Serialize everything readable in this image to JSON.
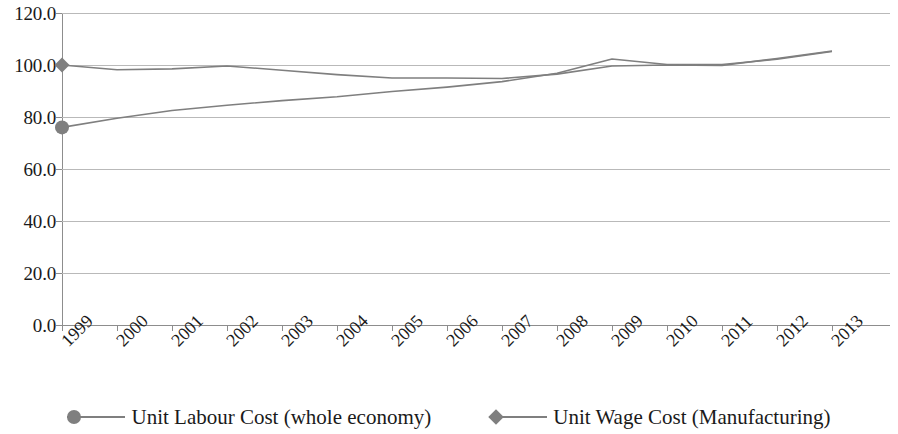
{
  "chart_data": {
    "type": "line",
    "title": "",
    "subtitle": "",
    "xlabel": "",
    "ylabel": "",
    "categories": [
      "1999",
      "2000",
      "2001",
      "2002",
      "2003",
      "2004",
      "2005",
      "2006",
      "2007",
      "2008",
      "2009",
      "2010",
      "2011",
      "2012",
      "2013"
    ],
    "x_tick_labels": [
      "1999",
      "2000",
      "2001",
      "2002",
      "2003",
      "2004",
      "2005",
      "2006",
      "2007",
      "2008",
      "2009",
      "2010",
      "2011",
      "2012",
      "2013"
    ],
    "y_tick_labels": [
      "0.0",
      "20.0",
      "40.0",
      "60.0",
      "80.0",
      "100.0",
      "120.0"
    ],
    "y_ticks": [
      0,
      20,
      40,
      60,
      80,
      100,
      120
    ],
    "ylim": [
      0,
      120
    ],
    "grid": true,
    "grid_axis": "y",
    "legend_position": "bottom",
    "series": [
      {
        "name": "Unit Labour Cost (whole economy)",
        "marker": "circle",
        "color": "#7f7f7f",
        "values": [
          76.0,
          79.5,
          82.5,
          84.5,
          86.3,
          87.8,
          89.8,
          91.5,
          93.6,
          96.8,
          102.3,
          100.2,
          100.2,
          102.2,
          105.2
        ]
      },
      {
        "name": "Unit Wage Cost (Manufacturing)",
        "marker": "diamond",
        "color": "#7f7f7f",
        "values": [
          100.0,
          98.2,
          98.5,
          99.6,
          98.0,
          96.3,
          95.0,
          95.0,
          94.8,
          96.5,
          99.6,
          100.0,
          99.8,
          102.5,
          105.4
        ]
      }
    ],
    "colors": {
      "series_line": "#7f7f7f",
      "gridline": "#b9b9b9",
      "axis": "#8d8d8d",
      "text": "#1a1a1a",
      "background": "#ffffff"
    }
  },
  "legend": {
    "items": [
      {
        "label": "Unit Labour Cost (whole economy)",
        "marker": "circle-marker-icon"
      },
      {
        "label": "Unit Wage Cost (Manufacturing)",
        "marker": "diamond-marker-icon"
      }
    ]
  }
}
